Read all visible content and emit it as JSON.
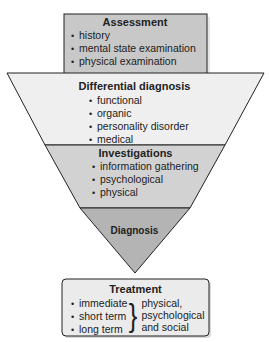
{
  "diagram": {
    "colors": {
      "assessment_fill": "#c8c8c8",
      "differential_fill": "#efefef",
      "investigations_fill": "#d2d2d2",
      "diagnosis_fill": "#b4b4b4",
      "treatment_fill": "#ebebeb",
      "stroke": "#222222"
    },
    "assessment": {
      "title": "Assessment",
      "items": [
        "history",
        "mental state examination",
        "physical examination"
      ]
    },
    "differential": {
      "title": "Differential diagnosis",
      "items": [
        "functional",
        "organic",
        "personality disorder",
        "medical"
      ]
    },
    "investigations": {
      "title": "Investigations",
      "items": [
        "information gathering",
        "psychological",
        "physical"
      ]
    },
    "diagnosis": {
      "title": "Diagnosis"
    },
    "treatment": {
      "title": "Treatment",
      "items": [
        "immediate",
        "short term",
        "long term"
      ],
      "brace": "}",
      "scope": [
        "physical,",
        "psychological",
        "and social"
      ]
    }
  }
}
